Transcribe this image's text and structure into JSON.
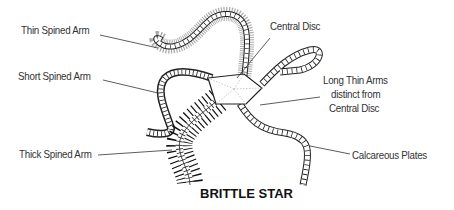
{
  "diagram": {
    "title": "BRITTLE STAR",
    "labels": {
      "thin_spined_arm": "Thin Spined Arm",
      "short_spined_arm": "Short Spined Arm",
      "thick_spined_arm": "Thick Spined Arm",
      "central_disc": "Central Disc",
      "long_thin_arms_1": "Long Thin Arms",
      "long_thin_arms_2": "distinct from",
      "long_thin_arms_3": "Central Disc",
      "calcareous_plates": "Calcareous Plates"
    },
    "colors": {
      "line": "#222222",
      "text": "#333333",
      "spine_gray": "#999999"
    }
  }
}
